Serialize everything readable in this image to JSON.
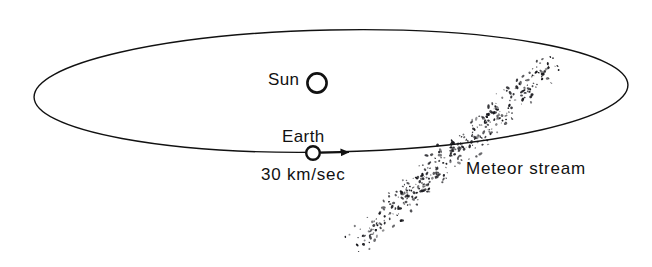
{
  "figure": {
    "background_color": "#ffffff",
    "ink_color": "#111111",
    "width": 652,
    "height": 267
  },
  "labels": {
    "sun": "Sun",
    "earth": "Earth",
    "speed": "30 km/sec",
    "meteor_stream": "Meteor stream"
  },
  "chart_data": {
    "type": "diagram",
    "elements": [
      {
        "name": "orbit-ellipse",
        "kind": "ellipse",
        "description": "Elongated ellipse representing Earth's orbit seen in perspective",
        "center_x": 331,
        "center_y": 91,
        "radius_x": 297,
        "radius_y": 61,
        "rotation_deg": -1.2,
        "stroke": "#111111",
        "stroke_width": 1.4,
        "fill": "none"
      },
      {
        "name": "sun-circle",
        "kind": "circle",
        "label": "Sun",
        "center_x": 317,
        "center_y": 83,
        "radius": 10,
        "stroke": "#111111",
        "stroke_width": 2.6,
        "fill": "none"
      },
      {
        "name": "earth-circle",
        "kind": "circle",
        "label": "Earth",
        "center_x": 313,
        "center_y": 153,
        "radius": 7,
        "stroke": "#111111",
        "stroke_width": 2.4,
        "fill": "none"
      },
      {
        "name": "velocity-arrow",
        "kind": "arrow",
        "label": "30 km/sec",
        "from_x": 321,
        "from_y": 153,
        "to_x": 356,
        "to_y": 152,
        "direction": "right",
        "stroke": "#111111"
      },
      {
        "name": "meteor-stream-band",
        "kind": "stippled-band",
        "label": "Meteor stream",
        "from_x": 352,
        "from_y": 246,
        "to_x": 556,
        "to_y": 60,
        "band_half_width": 20,
        "dot_count": 520,
        "angle_deg": -42,
        "stroke": "#111111",
        "description": "Diagonal swarm of small dots crossing the near side of the orbit"
      }
    ],
    "annotations": [
      {
        "text": "Sun",
        "x": 268,
        "y": 80
      },
      {
        "text": "Earth",
        "x": 282,
        "y": 137
      },
      {
        "text": "30 km/sec",
        "x": 261,
        "y": 175
      },
      {
        "text": "Meteor stream",
        "x": 466,
        "y": 169
      }
    ],
    "grid": false,
    "legend": "none"
  }
}
